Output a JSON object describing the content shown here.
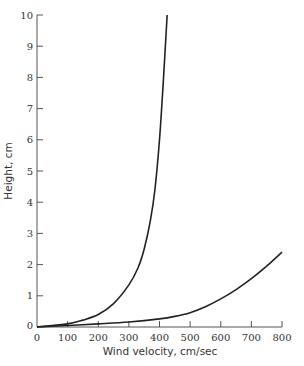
{
  "chart_data": {
    "type": "line",
    "title": "",
    "xlabel": "Wind velocity, cm/sec",
    "ylabel": "Height, cm",
    "xlim": [
      0,
      800
    ],
    "ylim": [
      0,
      10
    ],
    "x_ticks": [
      0,
      100,
      200,
      300,
      400,
      500,
      600,
      700,
      800
    ],
    "y_ticks": [
      0,
      1,
      2,
      3,
      4,
      5,
      6,
      7,
      8,
      9,
      10
    ],
    "x_tick_labels": [
      "0",
      "100",
      "200",
      "300",
      "400",
      "500",
      "600",
      "700",
      "800"
    ],
    "y_tick_labels": [
      "0",
      "1",
      "2",
      "3",
      "4",
      "5",
      "6",
      "7",
      "8",
      "9",
      "10"
    ],
    "grid": false,
    "legend": null,
    "series": [
      {
        "name": "curve-steep",
        "x": [
          0,
          100,
          150,
          200,
          250,
          300,
          330,
          350,
          370,
          385,
          400,
          412,
          425
        ],
        "y": [
          0,
          0.1,
          0.22,
          0.4,
          0.75,
          1.35,
          1.9,
          2.5,
          3.4,
          4.4,
          6.0,
          7.8,
          10.0
        ]
      },
      {
        "name": "curve-gradual",
        "x": [
          0,
          100,
          200,
          300,
          400,
          450,
          500,
          550,
          600,
          650,
          700,
          750,
          800
        ],
        "y": [
          0,
          0.05,
          0.1,
          0.16,
          0.26,
          0.34,
          0.46,
          0.65,
          0.9,
          1.2,
          1.55,
          1.95,
          2.4
        ]
      }
    ]
  }
}
